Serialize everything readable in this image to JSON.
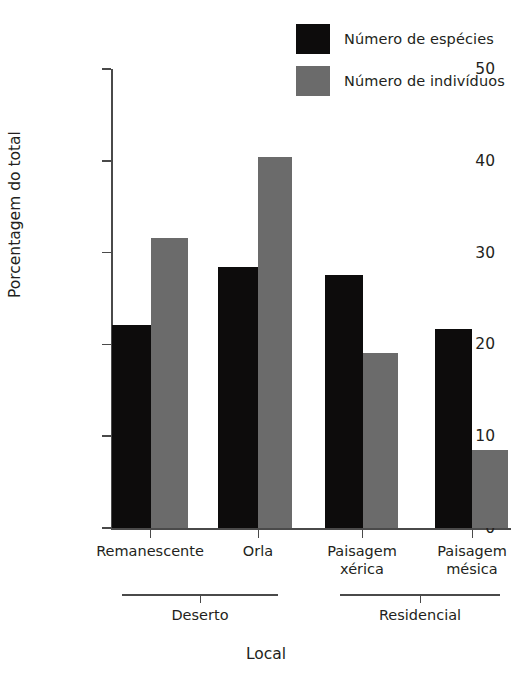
{
  "chart_data": {
    "type": "bar",
    "title": "",
    "xlabel": "Local",
    "ylabel": "Porcentagem do total",
    "categories": [
      "Remanescente",
      "Orla",
      "Paisagem xérica",
      "Paisagem mésica"
    ],
    "category_lines": [
      [
        "Remanescente"
      ],
      [
        "Orla"
      ],
      [
        "Paisagem",
        "xérica"
      ],
      [
        "Paisagem",
        "mésica"
      ]
    ],
    "groups": [
      {
        "label": "Deserto",
        "categories": [
          "Remanescente",
          "Orla"
        ]
      },
      {
        "label": "Residencial",
        "categories": [
          "Paisagem xérica",
          "Paisagem mésica"
        ]
      }
    ],
    "series": [
      {
        "name": "Número de espécies",
        "color": "#0d0c0c",
        "values": [
          22.1,
          28.4,
          27.6,
          21.7
        ]
      },
      {
        "name": "Número de indivíduos",
        "color": "#6b6b6b",
        "values": [
          31.6,
          40.4,
          19.1,
          8.5
        ]
      }
    ],
    "ylim": [
      0,
      50
    ],
    "yticks": [
      0,
      10,
      20,
      30,
      40,
      50
    ],
    "ytick_labels": [
      "0",
      "10",
      "20",
      "30",
      "40",
      "50"
    ],
    "grid": false,
    "legend_position": "top-right"
  },
  "axes": {
    "y_title": "Porcentagem do total",
    "x_title": "Local",
    "ytick_labels": [
      "50",
      "40",
      "30",
      "20",
      "10",
      "0"
    ]
  },
  "legend": {
    "entries": [
      {
        "label": "Número de espécies",
        "swatch": "black-square-swatch"
      },
      {
        "label": "Número de indivíduos",
        "swatch": "gray-square-swatch"
      }
    ]
  },
  "xaxis": {
    "tick_labels": [
      {
        "line1": "Remanescente",
        "line2": ""
      },
      {
        "line1": "Orla",
        "line2": ""
      },
      {
        "line1": "Paisagem",
        "line2": "xérica"
      },
      {
        "line1": "Paisagem",
        "line2": "mésica"
      }
    ],
    "group_labels": [
      "Deserto",
      "Residencial"
    ]
  },
  "colors": {
    "species": "#0d0c0c",
    "individuals": "#6b6b6b",
    "axis": "#4a4a4a",
    "text": "#231f20",
    "background": "#ffffff"
  }
}
